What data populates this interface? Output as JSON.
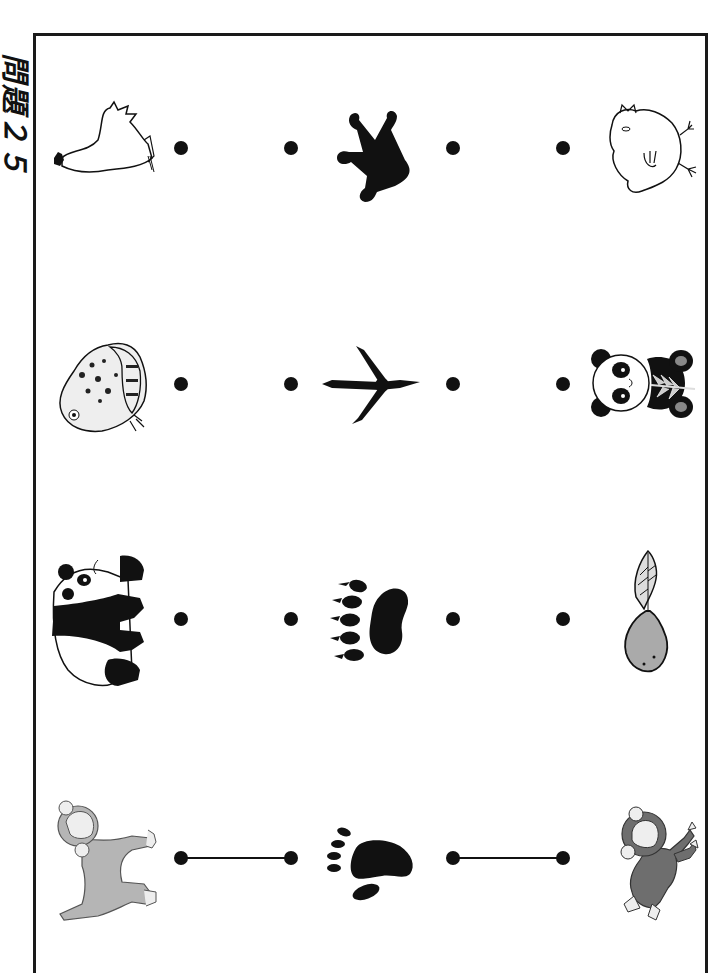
{
  "title": "問題２５",
  "columns": [
    "adult_animal",
    "footprint",
    "baby_animal"
  ],
  "rows": [
    {
      "y": 148,
      "adult": "rooster",
      "footprint": "frog-footprint",
      "baby": "chick",
      "connected_left": false,
      "connected_right": false
    },
    {
      "y": 384,
      "adult": "frog",
      "footprint": "bird-footprint",
      "baby": "panda-cub",
      "connected_left": false,
      "connected_right": false
    },
    {
      "y": 619,
      "adult": "panda",
      "footprint": "bear-paw-print",
      "baby": "tadpole",
      "connected_left": false,
      "connected_right": false
    },
    {
      "y": 858,
      "adult": "monkey",
      "footprint": "monkey-footprint",
      "baby": "baby-monkey",
      "connected_left": true,
      "connected_right": true
    }
  ],
  "dot_x": [
    181,
    291,
    453,
    563
  ],
  "colors": {
    "ink": "#111111",
    "grey_fill": "#b5b5b5",
    "dark_grey": "#6e6e6e",
    "paper": "#ffffff"
  }
}
